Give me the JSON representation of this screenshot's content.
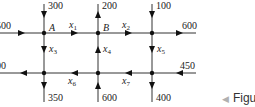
{
  "diagram": {
    "type": "traffic-flow-network",
    "colors": {
      "line": "#333333",
      "node": "#111111",
      "text": "#222222",
      "figure_arrow": "#b0b0b0"
    },
    "nodes": [
      {
        "id": "A",
        "label": "A",
        "x": 44,
        "y": 33
      },
      {
        "id": "B",
        "label": "B",
        "x": 98,
        "y": 33
      },
      {
        "id": "C",
        "label": "",
        "x": 152,
        "y": 33
      },
      {
        "id": "D",
        "label": "",
        "x": 44,
        "y": 73
      },
      {
        "id": "E",
        "label": "",
        "x": 98,
        "y": 73
      },
      {
        "id": "F",
        "label": "",
        "x": 152,
        "y": 73
      }
    ],
    "external_flows": {
      "left_top": "500",
      "top_A": "300",
      "top_B": "200",
      "top_C": "100",
      "right_top": "600",
      "right_bottom": "450",
      "left_bottom": "400",
      "bottom_D": "350",
      "bottom_E": "600",
      "bottom_F": "400"
    },
    "variables": {
      "x1": {
        "base": "x",
        "sub": "1"
      },
      "x2": {
        "base": "x",
        "sub": "2"
      },
      "x3": {
        "base": "x",
        "sub": "3"
      },
      "x4": {
        "base": "x",
        "sub": "4"
      },
      "x5": {
        "base": "x",
        "sub": "5"
      },
      "x6": {
        "base": "x",
        "sub": "6"
      },
      "x7": {
        "base": "x",
        "sub": "7"
      }
    }
  },
  "caption": {
    "arrow": "◀",
    "text": "Figu"
  }
}
